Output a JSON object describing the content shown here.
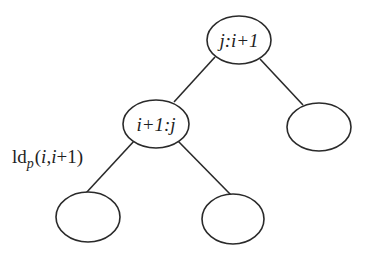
{
  "diagram": {
    "type": "binary-tree",
    "nodes": [
      {
        "id": "root",
        "label": "j:i+1",
        "cx": 239,
        "cy": 40,
        "rx": 32,
        "ry": 24
      },
      {
        "id": "left-child",
        "label": "i+1:j",
        "cx": 156,
        "cy": 124,
        "rx": 33,
        "ry": 24
      },
      {
        "id": "right-child",
        "label": "",
        "cx": 319,
        "cy": 127,
        "rx": 32,
        "ry": 24
      },
      {
        "id": "left-left-leaf",
        "label": "",
        "cx": 88,
        "cy": 217,
        "rx": 32,
        "ry": 25
      },
      {
        "id": "left-right-leaf",
        "label": "",
        "cx": 233,
        "cy": 219,
        "rx": 31,
        "ry": 25
      }
    ],
    "edges": [
      {
        "from": "root",
        "to": "left-child"
      },
      {
        "from": "root",
        "to": "right-child"
      },
      {
        "from": "left-child",
        "to": "left-left-leaf",
        "label": "ldp(i,i+1)"
      },
      {
        "from": "left-child",
        "to": "left-right-leaf"
      }
    ],
    "edge_label": {
      "prefix": "ld",
      "subscript": "p",
      "open": "(",
      "arg1": "i",
      "comma": ",",
      "arg2": "i",
      "plus": "+1",
      "close": ")"
    },
    "colors": {
      "stroke": "#2a2a2a",
      "text": "#1e1e1e",
      "background": "#ffffff"
    }
  }
}
